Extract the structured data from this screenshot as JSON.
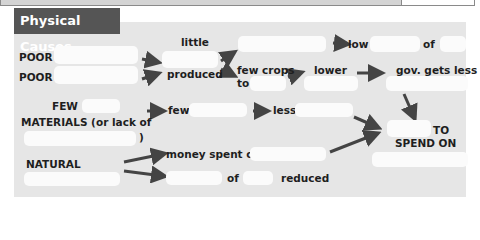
{
  "header": {
    "title": "Physical Causes"
  },
  "colors": {
    "header_bg": "#555555",
    "panel_bg": "#e6e6e6",
    "arrow": "#444444",
    "blank": "#fbfbfb"
  },
  "labels": {
    "poor1": "POOR",
    "poor2": "POOR",
    "little": "little",
    "produced": "produced",
    "few_crops": "few crops",
    "to": "to",
    "low": "low",
    "of1": "of",
    "lower": "lower",
    "gov_gets_less": "gov. gets less",
    "few_cap": "FEW",
    "materials": "MATERIALS (or lack of",
    "close_paren": ")",
    "few": "few",
    "less": "less",
    "to_cap": "TO",
    "spend_on": "SPEND ON",
    "natural": "NATURAL",
    "money_spent_on": "money spent on",
    "of2": "of",
    "reduced": "reduced"
  }
}
